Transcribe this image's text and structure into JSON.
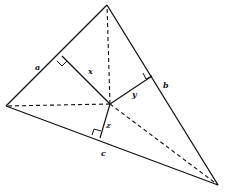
{
  "diagram": {
    "title": "",
    "colors": {
      "stroke": "#111111",
      "background": "#ffffff"
    },
    "vertices": {
      "top": {
        "x": 107,
        "y": 5
      },
      "left": {
        "x": 6,
        "y": 106
      },
      "bottom_right": {
        "x": 218,
        "y": 185
      }
    },
    "interior_point": {
      "x": 110,
      "y": 104
    },
    "feet": {
      "on_a": {
        "x": 62,
        "y": 56
      },
      "on_b": {
        "x": 152,
        "y": 76
      },
      "on_c": {
        "x": 100,
        "y": 138
      }
    },
    "side_labels": {
      "a": "a",
      "b": "b",
      "c": "c"
    },
    "distance_labels": {
      "x": "x",
      "y": "y",
      "z": "z"
    }
  }
}
